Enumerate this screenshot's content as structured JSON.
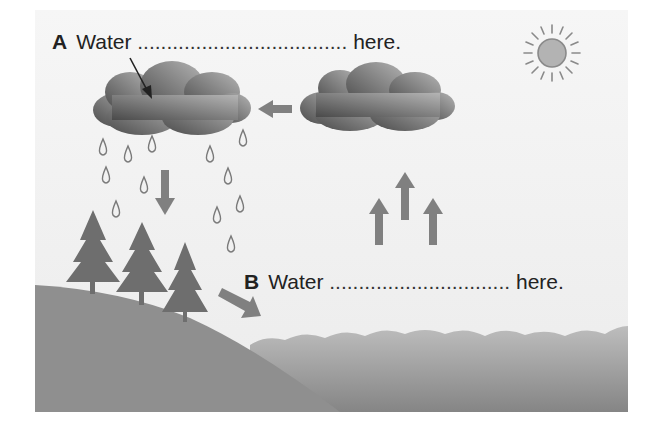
{
  "diagram": {
    "labels": [
      {
        "id": "A",
        "letter": "A",
        "prefix": "Water",
        "blank": "....................................",
        "suffix": "here."
      },
      {
        "id": "B",
        "letter": "B",
        "prefix": "Water",
        "blank": "...............................",
        "suffix": "here."
      }
    ],
    "elements": {
      "sun": "sun-icon",
      "clouds": [
        "rain-cloud",
        "moving-cloud"
      ],
      "arrows": [
        "cloud-movement-arrow-left",
        "precipitation-arrow-down",
        "evaporation-arrow-up-1",
        "evaporation-arrow-up-2",
        "evaporation-arrow-up-3",
        "runoff-arrow",
        "label-a-pointer-arrow"
      ],
      "trees": 3,
      "raindrops": 13,
      "landforms": [
        "hill",
        "sea"
      ]
    },
    "colors": {
      "sky": "#f1f1f1",
      "cloud_dark": "#555555",
      "cloud_light": "#a8a8a8",
      "arrow": "#7a7a7a",
      "tree": "#6e6e6e",
      "hill": "#8f8f8f",
      "sea_top": "#b5b5b5",
      "sea_bottom": "#888888",
      "sun": "#b0b0b0",
      "text": "#222222"
    }
  }
}
